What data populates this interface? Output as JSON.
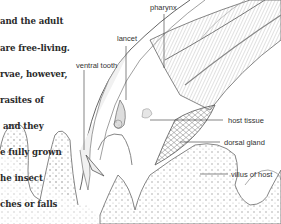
{
  "caption": {
    "lines": [
      "and the adult",
      "are free-living.",
      "rvae, however,",
      "rasites of",
      " and they",
      "e fully grown",
      "he insect",
      "ches or falls",
      "stream or pond."
    ]
  },
  "labels": {
    "pharynx": "pharynx",
    "lancet": "lancet",
    "ventral_tooth": "ventral tooth",
    "host_tissue": "host tissue",
    "dorsal_gland": "dorsal gland",
    "villus_of_host": "villus of host"
  },
  "colors": {
    "ink": "#555555",
    "text": "#2a2a2a",
    "shade": "#cfcfcf",
    "background": "#ffffff"
  }
}
